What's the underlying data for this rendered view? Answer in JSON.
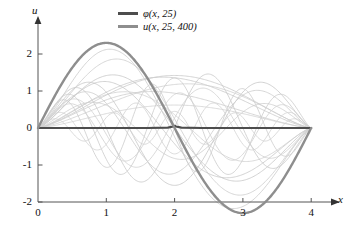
{
  "chart_data": {
    "type": "line",
    "title": "",
    "xlabel": "x",
    "ylabel": "u",
    "xlim": [
      0,
      4.3
    ],
    "ylim": [
      -2.5,
      2.6
    ],
    "xticks": [
      "0",
      "1",
      "2",
      "3",
      "4"
    ],
    "xtick_values": [
      0,
      1,
      2,
      3,
      4
    ],
    "yticks": [
      "2",
      "1",
      "0",
      "-1",
      "-2"
    ],
    "ytick_values": [
      2,
      1,
      0,
      -1,
      -2
    ],
    "grid": false,
    "legend_position": "top-center",
    "legend": [
      {
        "label": "φ(x, 25)",
        "color": "#4d4d4d"
      },
      {
        "label": "u(x, 25, 400)",
        "color": "#8e8e8e"
      }
    ],
    "annotations": [
      "All curves vanish at x = 0 and x = 4",
      "u(x, 25, 400) peaks near (1.05, 2.30) and troughs near (2.95, -2.30)",
      "φ(x, 25) is a narrow spike function that reads as a flat line on the axis u = 0"
    ],
    "series": [
      {
        "name": "φ(x, 25)",
        "color": "#4d4d4d",
        "width": 2.2,
        "kind": "spike",
        "domain": [
          0,
          4
        ],
        "x": [
          0,
          0.4,
          0.8,
          1.2,
          1.6,
          1.9,
          1.98,
          2.0,
          2.02,
          2.1,
          2.4,
          2.8,
          3.2,
          3.6,
          4.0
        ],
        "y": [
          0,
          0,
          0,
          0,
          0,
          0.01,
          0.04,
          0.06,
          0.04,
          0.01,
          0,
          0,
          0,
          0,
          0
        ]
      },
      {
        "name": "u(x, 25, 400)",
        "color": "#8e8e8e",
        "width": 2.4,
        "kind": "main",
        "domain": [
          0,
          4
        ],
        "amplitude": 2.3,
        "period": 4,
        "x": [
          0,
          0.25,
          0.5,
          0.75,
          1.0,
          1.05,
          1.25,
          1.5,
          1.75,
          2.0,
          2.25,
          2.5,
          2.75,
          2.95,
          3.0,
          3.25,
          3.5,
          3.75,
          4.0
        ],
        "y": [
          0,
          0.88,
          1.63,
          2.12,
          2.29,
          2.3,
          2.12,
          1.63,
          0.88,
          0.0,
          -0.88,
          -1.63,
          -2.12,
          -2.3,
          -2.29,
          -2.12,
          -1.63,
          -0.88,
          0
        ]
      },
      {
        "name": "harmonic-sum-1",
        "color": "#c9c9c9",
        "width": 0.8,
        "kind": "faint",
        "amplitude": 1.42,
        "half_waves": 1,
        "phase": 0
      },
      {
        "name": "harmonic-sum-2",
        "color": "#c9c9c9",
        "width": 0.8,
        "kind": "faint",
        "amplitude": 1.38,
        "half_waves": 1,
        "phase": 0.18
      },
      {
        "name": "harmonic-sum-3",
        "color": "#cfcfcf",
        "width": 0.8,
        "kind": "faint",
        "amplitude": 1.2,
        "half_waves": 1,
        "phase": -0.2
      },
      {
        "name": "harmonic-sum-4",
        "color": "#cccccc",
        "width": 0.8,
        "kind": "faint",
        "amplitude": 1.0,
        "half_waves": 1,
        "phase": 0.35
      },
      {
        "name": "harmonic-sum-5",
        "color": "#d2d2d2",
        "width": 0.8,
        "kind": "faint",
        "amplitude": 0.62,
        "half_waves": 1,
        "phase": 0
      },
      {
        "name": "harmonic-sum-6",
        "color": "#c6c6c6",
        "width": 0.8,
        "kind": "faint",
        "amplitude": 1.6,
        "half_waves": 2,
        "phase": 0
      },
      {
        "name": "harmonic-sum-7",
        "color": "#cacaca",
        "width": 0.8,
        "kind": "faint",
        "amplitude": 2.4,
        "half_waves": 2,
        "phase": 0.1
      },
      {
        "name": "harmonic-sum-8",
        "color": "#cdcdcd",
        "width": 0.8,
        "kind": "faint",
        "amplitude": 2.05,
        "half_waves": 2,
        "phase": -0.12
      },
      {
        "name": "harmonic-sum-9",
        "color": "#c8c8c8",
        "width": 0.8,
        "kind": "faint",
        "amplitude": 1.45,
        "half_waves": 2,
        "phase": 0.3
      },
      {
        "name": "harmonic-sum-10",
        "color": "#d0d0d0",
        "width": 0.8,
        "kind": "faint",
        "amplitude": 1.05,
        "half_waves": 2,
        "phase": -0.35
      },
      {
        "name": "harmonic-sum-11",
        "color": "#c7c7c7",
        "width": 0.8,
        "kind": "faint",
        "amplitude": 1.55,
        "half_waves": 3,
        "phase": 0
      },
      {
        "name": "harmonic-sum-12",
        "color": "#cbcbcb",
        "width": 0.8,
        "kind": "faint",
        "amplitude": 1.25,
        "half_waves": 3,
        "phase": 0.2
      },
      {
        "name": "harmonic-sum-13",
        "color": "#cecece",
        "width": 0.8,
        "kind": "faint",
        "amplitude": 0.85,
        "half_waves": 3,
        "phase": -0.25
      },
      {
        "name": "harmonic-sum-14",
        "color": "#c9c9c9",
        "width": 0.8,
        "kind": "faint",
        "amplitude": 1.5,
        "half_waves": 4,
        "phase": 0
      },
      {
        "name": "harmonic-sum-15",
        "color": "#d1d1d1",
        "width": 0.8,
        "kind": "faint",
        "amplitude": 1.1,
        "half_waves": 4,
        "phase": 0.25
      },
      {
        "name": "harmonic-sum-16",
        "color": "#cccccc",
        "width": 0.8,
        "kind": "faint",
        "amplitude": 1.35,
        "half_waves": 5,
        "phase": 0
      },
      {
        "name": "harmonic-sum-17",
        "color": "#d0d0d0",
        "width": 0.8,
        "kind": "faint",
        "amplitude": 0.95,
        "half_waves": 5,
        "phase": -0.3
      },
      {
        "name": "harmonic-sum-18",
        "color": "#cdcdcd",
        "width": 0.8,
        "kind": "faint",
        "amplitude": 1.2,
        "half_waves": 6,
        "phase": 0
      },
      {
        "name": "harmonic-sum-19",
        "color": "#d3d3d3",
        "width": 0.8,
        "kind": "faint",
        "amplitude": 0.7,
        "half_waves": 7,
        "phase": 0
      },
      {
        "name": "harmonic-sum-20",
        "color": "#d2d2d2",
        "width": 0.8,
        "kind": "faint",
        "amplitude": 0.45,
        "half_waves": 9,
        "phase": 0
      }
    ]
  },
  "axes": {
    "y_axis_label": "u",
    "x_axis_label": "x"
  }
}
